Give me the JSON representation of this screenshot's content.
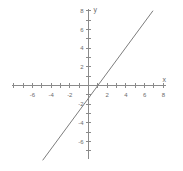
{
  "chart_data": {
    "type": "line",
    "title": "",
    "subtitle": "",
    "xlabel": "x",
    "ylabel": "y",
    "xlim": [
      -8,
      8
    ],
    "ylim": [
      -8,
      8
    ],
    "grid": false,
    "legend": false,
    "x_tick_labels": [
      "-6",
      "-4",
      "-2",
      "2",
      "4",
      "6",
      "8"
    ],
    "x_tick_values": [
      -6,
      -4,
      -2,
      2,
      4,
      6,
      8
    ],
    "y_tick_labels": [
      "8",
      "6",
      "4",
      "2",
      "-2",
      "-4",
      "-6"
    ],
    "y_tick_values": [
      8,
      6,
      4,
      2,
      -2,
      -4,
      -6
    ],
    "x_minor_ticks": [
      -7,
      -6,
      -5,
      -4,
      -3,
      -2,
      -1,
      1,
      2,
      3,
      4,
      5,
      6,
      7,
      8
    ],
    "y_minor_ticks": [
      -7,
      -6,
      -5,
      -4,
      -3,
      -2,
      -1,
      1,
      2,
      3,
      4,
      5,
      6,
      7,
      8
    ],
    "series": [
      {
        "name": "line",
        "slope": 1.36,
        "intercept": 0,
        "x": [
          -4.9,
          6.9
        ],
        "y": [
          -8.0,
          8.0
        ]
      }
    ],
    "colors": {
      "axis": "#8a8a8a",
      "line": "#7d7d7d",
      "text": "#6b6b6b",
      "background": "#ffffff"
    }
  },
  "axes": {
    "x_name": "x",
    "y_name": "y"
  },
  "ticks": {
    "x": [
      {
        "label": "-6",
        "value": -6
      },
      {
        "label": "-4",
        "value": -4
      },
      {
        "label": "-2",
        "value": -2
      },
      {
        "label": "2",
        "value": 2
      },
      {
        "label": "4",
        "value": 4
      },
      {
        "label": "6",
        "value": 6
      },
      {
        "label": "8",
        "value": 8
      }
    ],
    "y": [
      {
        "label": "8",
        "value": 8
      },
      {
        "label": "6",
        "value": 6
      },
      {
        "label": "4",
        "value": 4
      },
      {
        "label": "2",
        "value": 2
      },
      {
        "label": "-2",
        "value": -2
      },
      {
        "label": "-4",
        "value": -4
      },
      {
        "label": "-6",
        "value": -6
      }
    ]
  }
}
